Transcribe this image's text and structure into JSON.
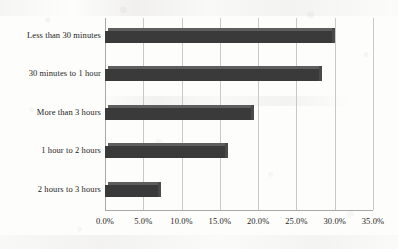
{
  "chart_data": {
    "type": "bar",
    "orientation": "horizontal",
    "title": "",
    "xlabel": "",
    "ylabel": "",
    "categories": [
      "Less than 30 minutes",
      "30 minutes to 1 hour",
      "More than 3 hours",
      "1 hour to 2 hours",
      "2 hours to 3 hours"
    ],
    "values": [
      30.0,
      28.3,
      19.5,
      16.0,
      7.3
    ],
    "value_labels": [
      "30.0%",
      "28.3%",
      "19.5%",
      "16.0%",
      "7.3%"
    ],
    "xlim": [
      0,
      35
    ],
    "xticks": [
      0,
      5,
      10,
      15,
      20,
      25,
      30,
      35
    ],
    "xtick_labels": [
      "0.0%",
      "5.0%",
      "10.0%",
      "15.0%",
      "20.0%",
      "25.0%",
      "30.0%",
      "35.0%"
    ],
    "grid": true,
    "grid_axis": "x",
    "legend": false,
    "series_color": "#3a3a3a",
    "gridline_color": "#c9c9c6",
    "background_color": "#fdfdfb"
  }
}
